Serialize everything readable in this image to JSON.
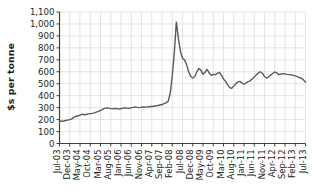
{
  "chart_data": {
    "type": "line",
    "title": "",
    "xlabel": "",
    "ylabel": "$s per tonne",
    "ylim": [
      0,
      1100
    ],
    "ytick_step": 100,
    "grid": true,
    "legend": "none",
    "line_color": "#595959",
    "grid_color": "#d9d9d9",
    "axis_color": "#404040",
    "background": "#ffffff",
    "ytick_labels": [
      "0",
      "100",
      "200",
      "300",
      "400",
      "500",
      "600",
      "700",
      "800",
      "900",
      "1,000",
      "1,100"
    ],
    "ytick_values": [
      0,
      100,
      200,
      300,
      400,
      500,
      600,
      700,
      800,
      900,
      1000,
      1100
    ],
    "xtick_labels": [
      "Jul-03",
      "Dec-03",
      "May-04",
      "Oct-04",
      "Mar-05",
      "Aug-05",
      "Jan-06",
      "Jun-06",
      "Nov-06",
      "Apr-07",
      "Sep-07",
      "Feb-08",
      "Jul-08",
      "Dec-08",
      "May-09",
      "Oct-09",
      "Mar-10",
      "Aug-10",
      "Jan-11",
      "Jun-11",
      "Nov-11",
      "Apr-12",
      "Sep-12",
      "Feb-13",
      "Jul-13"
    ],
    "xtick_interval_months": 5,
    "x_start": "Jul-03",
    "x_end": "Jul-13",
    "series": [
      {
        "name": "Price",
        "x": [
          "Jul-03",
          "Aug-03",
          "Sep-03",
          "Oct-03",
          "Nov-03",
          "Dec-03",
          "Jan-04",
          "Feb-04",
          "Mar-04",
          "Apr-04",
          "May-04",
          "Jun-04",
          "Jul-04",
          "Aug-04",
          "Sep-04",
          "Oct-04",
          "Nov-04",
          "Dec-04",
          "Jan-05",
          "Feb-05",
          "Mar-05",
          "Apr-05",
          "May-05",
          "Jun-05",
          "Jul-05",
          "Aug-05",
          "Sep-05",
          "Oct-05",
          "Nov-05",
          "Dec-05",
          "Jan-06",
          "Feb-06",
          "Mar-06",
          "Apr-06",
          "May-06",
          "Jun-06",
          "Jul-06",
          "Aug-06",
          "Sep-06",
          "Oct-06",
          "Nov-06",
          "Dec-06",
          "Jan-07",
          "Feb-07",
          "Mar-07",
          "Apr-07",
          "May-07",
          "Jun-07",
          "Jul-07",
          "Aug-07",
          "Sep-07",
          "Oct-07",
          "Nov-07",
          "Dec-07",
          "Jan-08",
          "Feb-08",
          "Mar-08",
          "Apr-08",
          "May-08",
          "Jun-08",
          "Jul-08",
          "Aug-08",
          "Sep-08",
          "Oct-08",
          "Nov-08",
          "Dec-08",
          "Jan-09",
          "Feb-09",
          "Mar-09",
          "Apr-09",
          "May-09",
          "Jun-09",
          "Jul-09",
          "Aug-09",
          "Sep-09",
          "Oct-09",
          "Nov-09",
          "Dec-09",
          "Jan-10",
          "Feb-10",
          "Mar-10",
          "Apr-10",
          "May-10",
          "Jun-10",
          "Jul-10",
          "Aug-10",
          "Sep-10",
          "Oct-10",
          "Nov-10",
          "Dec-10",
          "Jan-11",
          "Feb-11",
          "Mar-11",
          "Apr-11",
          "May-11",
          "Jun-11",
          "Jul-11",
          "Aug-11",
          "Sep-11",
          "Oct-11",
          "Nov-11",
          "Dec-11",
          "Jan-12",
          "Feb-12",
          "Mar-12",
          "Apr-12",
          "May-12",
          "Jun-12",
          "Jul-12",
          "Aug-12",
          "Sep-12",
          "Oct-12",
          "Nov-12",
          "Dec-12",
          "Jan-13",
          "Feb-13",
          "Mar-13",
          "Apr-13",
          "May-13",
          "Jun-13",
          "Jul-13"
        ],
        "values": [
          188,
          186,
          188,
          192,
          196,
          200,
          206,
          218,
          228,
          232,
          238,
          246,
          240,
          242,
          248,
          250,
          252,
          256,
          262,
          268,
          276,
          286,
          294,
          298,
          296,
          292,
          290,
          294,
          292,
          288,
          292,
          296,
          298,
          296,
          294,
          300,
          302,
          306,
          302,
          300,
          304,
          306,
          304,
          306,
          308,
          310,
          312,
          316,
          318,
          322,
          326,
          334,
          340,
          352,
          420,
          560,
          760,
          1015,
          880,
          770,
          712,
          700,
          660,
          600,
          560,
          548,
          560,
          600,
          628,
          612,
          580,
          596,
          620,
          590,
          570,
          578,
          576,
          586,
          596,
          570,
          540,
          520,
          492,
          468,
          462,
          480,
          500,
          516,
          520,
          506,
          496,
          506,
          518,
          524,
          540,
          556,
          574,
          590,
          600,
          588,
          560,
          548,
          556,
          572,
          586,
          598,
          590,
          576,
          580,
          584,
          582,
          578,
          576,
          574,
          570,
          566,
          560,
          552,
          546,
          532,
          512
        ]
      }
    ],
    "annotations": {
      "peak_label": "1,015 at Feb-08",
      "start_value": 188,
      "end_value": 512
    }
  },
  "axes": {
    "y_axis_title": "$s per tonne"
  }
}
